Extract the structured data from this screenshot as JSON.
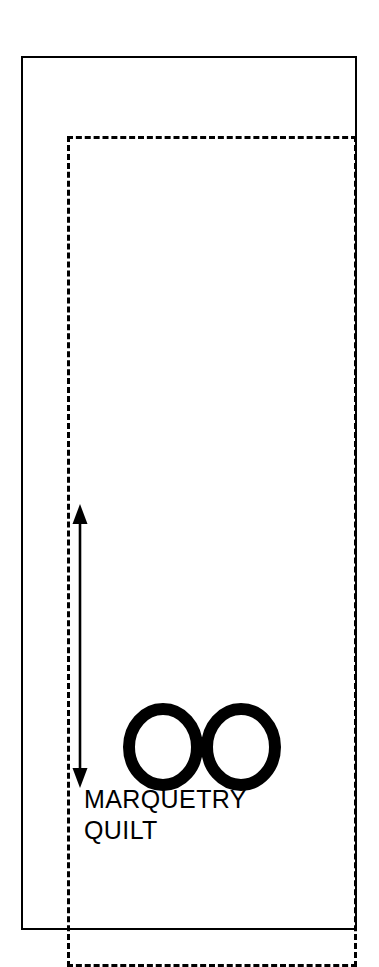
{
  "figure": {
    "name": "marquetry-quilt-pattern-diagram",
    "background_color": "#ffffff",
    "ink_color": "#000000"
  },
  "quilt_outline": {
    "label": "quilt outer edge",
    "style": "solid",
    "stroke_color": "#000000",
    "stroke_width": 2
  },
  "stitch_line": {
    "label": "stitching seam line",
    "style": "dashed",
    "stroke_color": "#000000",
    "stroke_width": 3
  },
  "dimension_arrow": {
    "icon": "double-headed-vertical-arrow-icon",
    "direction": "vertical",
    "heads": "both",
    "stroke_color": "#000000",
    "value_label": ""
  },
  "mark": {
    "icon": "double-circle-oo-icon",
    "text": "OO",
    "count": 2,
    "stroke_color": "#000000"
  },
  "caption": {
    "lines": [
      "MARQUETRY",
      "QUILT"
    ],
    "line1": "MARQUETRY",
    "line2": "QUILT",
    "color": "#000000"
  }
}
